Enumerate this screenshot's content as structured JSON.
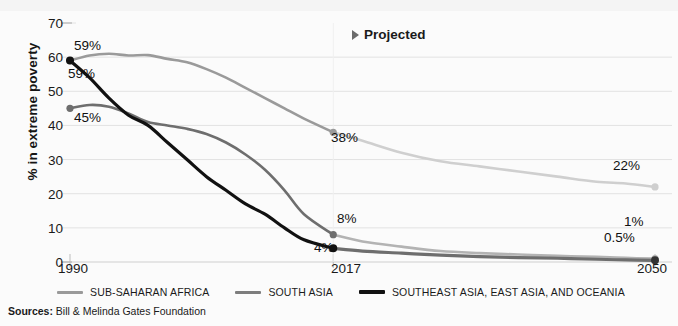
{
  "chart_data": {
    "type": "line",
    "title": "",
    "xlabel": "",
    "ylabel": "% in extreme poverty",
    "xlim": [
      1990,
      2050
    ],
    "ylim": [
      0,
      70
    ],
    "grid": true,
    "ytick_labels": [
      "70",
      "60",
      "50",
      "40",
      "30",
      "20",
      "10",
      "0"
    ],
    "ytick_values": [
      70,
      60,
      50,
      40,
      30,
      20,
      10,
      0
    ],
    "xtick_labels": [
      "1990",
      "2017",
      "2050"
    ],
    "xtick_values": [
      1990,
      2017,
      2050
    ],
    "projection_start": 2017,
    "annotation": "Projected",
    "legend_position": "bottom",
    "series": [
      {
        "name": "SUB-SAHARAN AFRICA",
        "color": "#9a9a9a",
        "projected_color": "#cfcfcf",
        "start_label": "59%",
        "mid_label": "38%",
        "end_label": "22%",
        "x": [
          1990,
          1992,
          1994,
          1996,
          1998,
          2000,
          2002,
          2004,
          2006,
          2008,
          2010,
          2012,
          2014,
          2017,
          2020,
          2024,
          2028,
          2032,
          2036,
          2040,
          2044,
          2047,
          2050
        ],
        "y": [
          59,
          60.5,
          61,
          60.5,
          60.6,
          59.5,
          58.5,
          56.5,
          54,
          51,
          48,
          45,
          42,
          38,
          35.5,
          32,
          29.5,
          28,
          26.5,
          25,
          23.5,
          23,
          22
        ]
      },
      {
        "name": "SOUTH ASIA",
        "color": "#6e6e6e",
        "projected_color": "#b3b3b3",
        "start_label": "45%",
        "mid_label": "8%",
        "end_label": "1%",
        "x": [
          1990,
          1992,
          1994,
          1996,
          1998,
          2000,
          2002,
          2004,
          2006,
          2008,
          2010,
          2012,
          2014,
          2017,
          2020,
          2024,
          2028,
          2032,
          2036,
          2040,
          2044,
          2047,
          2050
        ],
        "y": [
          45,
          46,
          45.5,
          43.5,
          41,
          40,
          39,
          37.5,
          35,
          31.5,
          27,
          21,
          14,
          8,
          6,
          4.5,
          3.2,
          2.6,
          2.2,
          1.8,
          1.5,
          1.2,
          1
        ]
      },
      {
        "name": "SOUTHEAST ASIA, EAST ASIA, AND OCEANIA",
        "color": "#111111",
        "projected_color": "#6e6e6e",
        "start_label": "59%",
        "mid_label": "4%",
        "end_label": "0.5%",
        "x": [
          1990,
          1992,
          1994,
          1996,
          1998,
          2000,
          2002,
          2004,
          2006,
          2008,
          2010,
          2012,
          2014,
          2017,
          2020,
          2024,
          2028,
          2032,
          2036,
          2040,
          2044,
          2047,
          2050
        ],
        "y": [
          59,
          54,
          48,
          43,
          40,
          35,
          30,
          25,
          21,
          17,
          14,
          10,
          6.5,
          4,
          3.2,
          2.6,
          2,
          1.6,
          1.3,
          1.1,
          0.8,
          0.6,
          0.5
        ]
      }
    ]
  },
  "labels": {
    "ssa_start": "59%",
    "sea_start": "59%",
    "sa_start": "45%",
    "ssa_2017": "38%",
    "sa_2017": "8%",
    "sea_2017": "4%",
    "ssa_2050": "22%",
    "sa_2050": "1%",
    "sea_2050": "0.5%"
  },
  "axis": {
    "y_title": "% in extreme poverty",
    "x_1990": "1990",
    "x_2017": "2017",
    "x_2050": "2050",
    "y_70": "70",
    "y_60": "60",
    "y_50": "50",
    "y_40": "40",
    "y_30": "30",
    "y_20": "20",
    "y_10": "10",
    "y_0": "0"
  },
  "annotation": {
    "projected": "Projected"
  },
  "legend": {
    "items": [
      {
        "label": "SUB-SAHARAN AFRICA",
        "color": "#9a9a9a"
      },
      {
        "label": "SOUTH ASIA",
        "color": "#7d7d7d"
      },
      {
        "label": "SOUTHEAST ASIA, EAST ASIA, AND OCEANIA",
        "color": "#111111"
      }
    ]
  },
  "sources": {
    "label": "Sources:",
    "text": " Bill & Melinda Gates Foundation"
  }
}
